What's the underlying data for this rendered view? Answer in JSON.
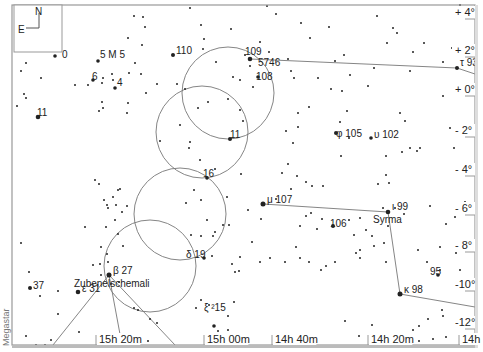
{
  "credit": "Megastar",
  "compass": {
    "north": "N",
    "east": "E"
  },
  "frame": {
    "left": 12,
    "top": 5,
    "right": 475,
    "bottom": 345
  },
  "ra_ticks": [
    {
      "label": "15h 20m",
      "x": 96
    },
    {
      "label": "15h 00m",
      "x": 204
    },
    {
      "label": "14h 40m",
      "x": 272
    },
    {
      "label": "14h 20m",
      "x": 368
    },
    {
      "label": "14h",
      "x": 459
    }
  ],
  "dec_ticks": [
    {
      "label": "+ 4°",
      "y": 16
    },
    {
      "label": "+ 2°",
      "y": 54
    },
    {
      "label": "+ 0°",
      "y": 93
    },
    {
      "label": "- 2°",
      "y": 134
    },
    {
      "label": "- 4°",
      "y": 173
    },
    {
      "label": "- 6°",
      "y": 212
    },
    {
      "label": "- 8°",
      "y": 249
    },
    {
      "label": "-10°",
      "y": 288
    },
    {
      "label": "-12°",
      "y": 326
    }
  ],
  "circles": [
    {
      "cx": 228,
      "cy": 93,
      "r": 46
    },
    {
      "cx": 202,
      "cy": 132,
      "r": 46
    },
    {
      "cx": 180,
      "cy": 214,
      "r": 46
    },
    {
      "cx": 150,
      "cy": 266,
      "r": 46
    }
  ],
  "constellation_lines": [
    [
      [
        250,
        59
      ],
      [
        457,
        68
      ],
      [
        475,
        74
      ]
    ],
    [
      [
        263,
        204
      ],
      [
        388,
        212
      ],
      [
        400,
        294
      ],
      [
        475,
        307
      ]
    ],
    [
      [
        109,
        275
      ],
      [
        53,
        345
      ]
    ],
    [
      [
        109,
        275
      ],
      [
        122,
        345
      ]
    ],
    [
      [
        109,
        275
      ],
      [
        175,
        345
      ]
    ]
  ],
  "labels": [
    {
      "text": "0",
      "x": 62,
      "y": 58
    },
    {
      "text": "5 M 5",
      "x": 100,
      "y": 58
    },
    {
      "text": "6",
      "x": 92,
      "y": 80
    },
    {
      "text": "4",
      "x": 117,
      "y": 86
    },
    {
      "text": "11",
      "x": 37,
      "y": 116
    },
    {
      "text": "110",
      "x": 176,
      "y": 54
    },
    {
      "text": "109",
      "x": 245,
      "y": 55
    },
    {
      "text": "5746",
      "x": 258,
      "y": 66
    },
    {
      "text": "108",
      "x": 256,
      "y": 80
    },
    {
      "text": "11",
      "x": 230,
      "y": 138
    },
    {
      "text": "16",
      "x": 203,
      "y": 177
    },
    {
      "text": "δ 19",
      "x": 186,
      "y": 258
    },
    {
      "text": "β  27",
      "x": 113,
      "y": 274
    },
    {
      "text": "Zubenelschemali",
      "x": 74,
      "y": 287
    },
    {
      "text": "ε 31",
      "x": 82,
      "y": 292
    },
    {
      "text": "37",
      "x": 33,
      "y": 289
    },
    {
      "text": "ξ ²15",
      "x": 204,
      "y": 311
    },
    {
      "text": "μ 107",
      "x": 267,
      "y": 203
    },
    {
      "text": "106",
      "x": 330,
      "y": 227
    },
    {
      "text": "ι 99",
      "x": 392,
      "y": 210
    },
    {
      "text": "Syrma",
      "x": 373,
      "y": 223
    },
    {
      "text": "φ 105",
      "x": 336,
      "y": 137
    },
    {
      "text": "υ 102",
      "x": 374,
      "y": 138
    },
    {
      "text": "95",
      "x": 430,
      "y": 275
    },
    {
      "text": "κ 98",
      "x": 404,
      "y": 293
    },
    {
      "text": "τ 93",
      "x": 460,
      "y": 66
    }
  ],
  "stars": [
    [
      55,
      56,
      1.8
    ],
    [
      38,
      117,
      2.3
    ],
    [
      26,
      63,
      1
    ],
    [
      21,
      71,
      1
    ],
    [
      41,
      78,
      1
    ],
    [
      24,
      94,
      1
    ],
    [
      26,
      98,
      1
    ],
    [
      17,
      106,
      1
    ],
    [
      98,
      61,
      1.8
    ],
    [
      93,
      80,
      1.8
    ],
    [
      103,
      78,
      1
    ],
    [
      113,
      80,
      1
    ],
    [
      115,
      88,
      1.8
    ],
    [
      88,
      85,
      1
    ],
    [
      75,
      85,
      1
    ],
    [
      102,
      83,
      1
    ],
    [
      129,
      73,
      1
    ],
    [
      128,
      38,
      1
    ],
    [
      134,
      16,
      1
    ],
    [
      143,
      17,
      1
    ],
    [
      145,
      27,
      1
    ],
    [
      142,
      45,
      1
    ],
    [
      135,
      63,
      1
    ],
    [
      141,
      74,
      1
    ],
    [
      112,
      74,
      1
    ],
    [
      102,
      102,
      1
    ],
    [
      128,
      103,
      1
    ],
    [
      127,
      113,
      1
    ],
    [
      103,
      108,
      1
    ],
    [
      99,
      111,
      1
    ],
    [
      146,
      93,
      1
    ],
    [
      157,
      84,
      1
    ],
    [
      173,
      55,
      2
    ],
    [
      190,
      8,
      1
    ],
    [
      201,
      25,
      1
    ],
    [
      204,
      39,
      1
    ],
    [
      203,
      49,
      1
    ],
    [
      216,
      62,
      1
    ],
    [
      231,
      29,
      1
    ],
    [
      250,
      59,
      2.3
    ],
    [
      245,
      55,
      1
    ],
    [
      233,
      77,
      1
    ],
    [
      260,
      42,
      1
    ],
    [
      250,
      66,
      1
    ],
    [
      253,
      87,
      1
    ],
    [
      258,
      77,
      1.8
    ],
    [
      269,
      52,
      1
    ],
    [
      240,
      80,
      1
    ],
    [
      177,
      84,
      1
    ],
    [
      185,
      89,
      1
    ],
    [
      198,
      108,
      1
    ],
    [
      208,
      102,
      1
    ],
    [
      228,
      99,
      1
    ],
    [
      240,
      110,
      1
    ],
    [
      230,
      139,
      2
    ],
    [
      243,
      121,
      1
    ],
    [
      180,
      125,
      1
    ],
    [
      190,
      142,
      1
    ],
    [
      189,
      148,
      1
    ],
    [
      200,
      160,
      1
    ],
    [
      207,
      178,
      1.8
    ],
    [
      215,
      169,
      1
    ],
    [
      241,
      174,
      1
    ],
    [
      160,
      141,
      1
    ],
    [
      227,
      197,
      1
    ],
    [
      248,
      210,
      1
    ],
    [
      261,
      219,
      1
    ],
    [
      194,
      190,
      1
    ],
    [
      186,
      203,
      1
    ],
    [
      201,
      200,
      1
    ],
    [
      207,
      220,
      1
    ],
    [
      215,
      232,
      1
    ],
    [
      213,
      236,
      1
    ],
    [
      223,
      225,
      1
    ],
    [
      229,
      225,
      1
    ],
    [
      201,
      236,
      1
    ],
    [
      191,
      235,
      1
    ],
    [
      204,
      258,
      1.8
    ],
    [
      212,
      256,
      1
    ],
    [
      127,
      206,
      1
    ],
    [
      122,
      212,
      1
    ],
    [
      116,
      205,
      1
    ],
    [
      104,
      200,
      1
    ],
    [
      108,
      208,
      1
    ],
    [
      118,
      190,
      1
    ],
    [
      113,
      197,
      1
    ],
    [
      99,
      184,
      1
    ],
    [
      107,
      205,
      1
    ],
    [
      120,
      189,
      1
    ],
    [
      123,
      246,
      1
    ],
    [
      118,
      234,
      1
    ],
    [
      106,
      227,
      1
    ],
    [
      115,
      220,
      1
    ],
    [
      95,
      180,
      1
    ],
    [
      85,
      227,
      1
    ],
    [
      101,
      275,
      1
    ],
    [
      109,
      275,
      2.5
    ],
    [
      111,
      284,
      1
    ],
    [
      100,
      264,
      1
    ],
    [
      93,
      265,
      1
    ],
    [
      108,
      262,
      1
    ],
    [
      78,
      292,
      2.3
    ],
    [
      30,
      288,
      2
    ],
    [
      29,
      272,
      1
    ],
    [
      40,
      296,
      1
    ],
    [
      21,
      243,
      1
    ],
    [
      58,
      291,
      1
    ],
    [
      58,
      314,
      1
    ],
    [
      79,
      332,
      1
    ],
    [
      26,
      336,
      1
    ],
    [
      36,
      345,
      1
    ],
    [
      45,
      345,
      1
    ],
    [
      51,
      340,
      1
    ],
    [
      101,
      247,
      1
    ],
    [
      107,
      254,
      1
    ],
    [
      119,
      282,
      1
    ],
    [
      134,
      308,
      1
    ],
    [
      138,
      310,
      1
    ],
    [
      150,
      319,
      1
    ],
    [
      157,
      323,
      1
    ],
    [
      148,
      341,
      1
    ],
    [
      201,
      300,
      1
    ],
    [
      196,
      308,
      1
    ],
    [
      209,
      305,
      1
    ],
    [
      214,
      326,
      1.8
    ],
    [
      218,
      331,
      1
    ],
    [
      209,
      338,
      1
    ],
    [
      219,
      344,
      1
    ],
    [
      228,
      330,
      1
    ],
    [
      234,
      302,
      1
    ],
    [
      228,
      316,
      1
    ],
    [
      240,
      257,
      1
    ],
    [
      235,
      272,
      1
    ],
    [
      239,
      271,
      1
    ],
    [
      270,
      258,
      1
    ],
    [
      260,
      262,
      1
    ],
    [
      232,
      264,
      1
    ],
    [
      252,
      242,
      1
    ],
    [
      263,
      204,
      2.5
    ],
    [
      306,
      216,
      1
    ],
    [
      300,
      226,
      1
    ],
    [
      311,
      213,
      1
    ],
    [
      322,
      219,
      1
    ],
    [
      333,
      226,
      2
    ],
    [
      317,
      229,
      1
    ],
    [
      296,
      247,
      1
    ],
    [
      300,
      258,
      1
    ],
    [
      285,
      262,
      1
    ],
    [
      309,
      262,
      1
    ],
    [
      321,
      270,
      1
    ],
    [
      326,
      266,
      1
    ],
    [
      335,
      262,
      1
    ],
    [
      356,
      253,
      1
    ],
    [
      360,
      258,
      1
    ],
    [
      366,
      230,
      1
    ],
    [
      372,
      236,
      1
    ],
    [
      384,
      243,
      1
    ],
    [
      374,
      246,
      1
    ],
    [
      386,
      262,
      1
    ],
    [
      388,
      212,
      2.3
    ],
    [
      383,
      208,
      1
    ],
    [
      395,
      208,
      1
    ],
    [
      404,
      214,
      1
    ],
    [
      388,
      226,
      1
    ],
    [
      354,
      235,
      1
    ],
    [
      360,
      250,
      1
    ],
    [
      400,
      294,
      2.5
    ],
    [
      418,
      250,
      1
    ],
    [
      427,
      262,
      1
    ],
    [
      438,
      275,
      1.8
    ],
    [
      440,
      270,
      1
    ],
    [
      460,
      270,
      1
    ],
    [
      440,
      247,
      1
    ],
    [
      456,
      253,
      1
    ],
    [
      442,
      310,
      1
    ],
    [
      443,
      316,
      1
    ],
    [
      428,
      319,
      1
    ],
    [
      419,
      326,
      1
    ],
    [
      404,
      336,
      1
    ],
    [
      378,
      340,
      1
    ],
    [
      336,
      346,
      1
    ],
    [
      359,
      336,
      1
    ],
    [
      372,
      325,
      1
    ],
    [
      345,
      321,
      1
    ],
    [
      413,
      330,
      1
    ],
    [
      419,
      341,
      1
    ],
    [
      433,
      339,
      1
    ],
    [
      446,
      337,
      1
    ],
    [
      336,
      133,
      2
    ],
    [
      349,
      138,
      1
    ],
    [
      371,
      138,
      1.8
    ],
    [
      386,
      156,
      1
    ],
    [
      402,
      152,
      1
    ],
    [
      410,
      148,
      1
    ],
    [
      341,
      156,
      1
    ],
    [
      323,
      186,
      1
    ],
    [
      349,
      220,
      1
    ],
    [
      360,
      218,
      1
    ],
    [
      378,
      184,
      1
    ],
    [
      386,
      175,
      1
    ],
    [
      389,
      183,
      1
    ],
    [
      446,
      224,
      1
    ],
    [
      465,
      202,
      1
    ],
    [
      430,
      206,
      1
    ],
    [
      455,
      217,
      1
    ],
    [
      282,
      173,
      1
    ],
    [
      288,
      164,
      1
    ],
    [
      293,
      143,
      1
    ],
    [
      298,
      127,
      1
    ],
    [
      286,
      131,
      1
    ],
    [
      297,
      176,
      1
    ],
    [
      306,
      182,
      1
    ],
    [
      312,
      186,
      1
    ],
    [
      276,
      199,
      1
    ],
    [
      291,
      189,
      1
    ],
    [
      344,
      55,
      1
    ],
    [
      350,
      75,
      1
    ],
    [
      374,
      68,
      1
    ],
    [
      368,
      86,
      1
    ],
    [
      342,
      91,
      1
    ],
    [
      331,
      89,
      1
    ],
    [
      335,
      61,
      1
    ],
    [
      329,
      27,
      1
    ],
    [
      310,
      38,
      1
    ],
    [
      318,
      78,
      1
    ],
    [
      347,
      111,
      1
    ],
    [
      340,
      122,
      1
    ],
    [
      400,
      113,
      1
    ],
    [
      405,
      121,
      1
    ],
    [
      417,
      151,
      1
    ],
    [
      420,
      148,
      1
    ],
    [
      410,
      71,
      1
    ],
    [
      387,
      43,
      1
    ],
    [
      377,
      16,
      1
    ],
    [
      393,
      28,
      1
    ],
    [
      397,
      33,
      1
    ],
    [
      413,
      52,
      1
    ],
    [
      424,
      43,
      1
    ],
    [
      443,
      62,
      1
    ],
    [
      443,
      96,
      1
    ],
    [
      450,
      128,
      1
    ],
    [
      454,
      148,
      1
    ],
    [
      452,
      48,
      1
    ],
    [
      466,
      45,
      1
    ],
    [
      457,
      68,
      2
    ],
    [
      460,
      5,
      1
    ],
    [
      301,
      23,
      1
    ],
    [
      294,
      78,
      1
    ],
    [
      291,
      71,
      1
    ],
    [
      288,
      59,
      1
    ],
    [
      309,
      107,
      1
    ],
    [
      298,
      113,
      1
    ],
    [
      276,
      14,
      1
    ],
    [
      267,
      6,
      1
    ]
  ]
}
